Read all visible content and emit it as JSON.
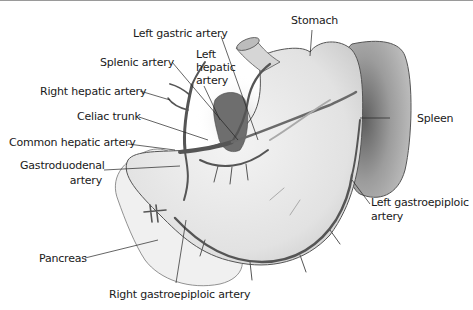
{
  "diagram": {
    "labels": {
      "left_gastric_artery": "Left gastric artery",
      "splenic_artery": "Splenic artery",
      "left_hepatic_artery": [
        "Left",
        "hepatic",
        "artery"
      ],
      "right_hepatic_artery": "Right hepatic artery",
      "celiac_trunk": "Celiac trunk",
      "common_hepatic_artery": "Common hepatic artery",
      "gastroduodenal_artery": [
        "Gastroduodenal",
        "artery"
      ],
      "pancreas": "Pancreas",
      "right_gastroepiploic_artery": "Right gastroepiploic artery",
      "stomach": "Stomach",
      "spleen": "Spleen",
      "left_gastroepiploic_artery": [
        "Left gastroepiploic",
        "artery"
      ]
    },
    "colors": {
      "organ_fill": "#e8e8e8",
      "spleen_fill": "#a8a8a8",
      "artery": "#5a5a5a",
      "liver_shadow": "#7a7a7a",
      "outline": "#555555",
      "label_text": "#1a1a1a"
    }
  }
}
